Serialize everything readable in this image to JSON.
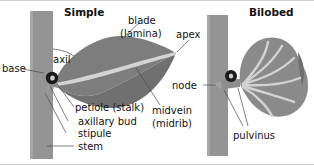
{
  "figure": {
    "title_left": "Simple",
    "title_right": "Bilobed",
    "background_color": "#ffffff",
    "text_color": "#111111",
    "stem_color": "#949494",
    "blade_color": "#7d7d7d",
    "lobe_color": "#8a8a8a",
    "vein_color": "#d3d3d3",
    "petiole_color": "#8d8d8d",
    "bud_color": "#1a1a1a",
    "leader_color": "#4a4a4a"
  },
  "labels": {
    "simple": {
      "blade": "blade",
      "lamina": "(lamina)",
      "apex": "apex",
      "axil": "axil",
      "base": "base",
      "petiole": "petiole (stalk)",
      "axillary_bud": "axillary bud",
      "stipule": "stipule",
      "stem": "stem",
      "midvein": "midvein",
      "midrib": "(midrib)"
    },
    "bilobed": {
      "node": "node",
      "pulvinus": "pulvinus"
    }
  },
  "diagram_parts": [
    {
      "name": "stem",
      "panel": "simple",
      "description": "vertical gray stem bar"
    },
    {
      "name": "petiole",
      "panel": "simple",
      "description": "leaf stalk attaching blade to stem"
    },
    {
      "name": "axillary-bud",
      "panel": "simple",
      "description": "dark bud in leaf axil"
    },
    {
      "name": "stipule",
      "panel": "simple",
      "description": "small appendage at petiole base"
    },
    {
      "name": "blade",
      "panel": "simple",
      "description": "broad elliptic lamina"
    },
    {
      "name": "midvein",
      "panel": "simple",
      "description": "central light vein along blade"
    },
    {
      "name": "apex",
      "panel": "simple",
      "description": "pointed tip of blade"
    },
    {
      "name": "axil",
      "panel": "simple",
      "description": "angle between stem and petiole"
    },
    {
      "name": "stem",
      "panel": "bilobed",
      "description": "vertical gray stem bar"
    },
    {
      "name": "node",
      "panel": "bilobed",
      "description": "stem point of leaf attachment"
    },
    {
      "name": "pulvinus",
      "panel": "bilobed",
      "description": "swollen petiole base"
    },
    {
      "name": "lobes",
      "panel": "bilobed",
      "description": "two rounded leaf lobes with radiating veins"
    }
  ]
}
